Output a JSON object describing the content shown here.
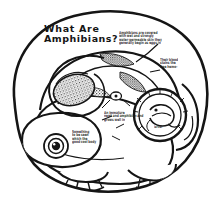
{
  "meta": {
    "medium": "hand-drawn black ink line illustration on white paper",
    "background_color": "#ffffff",
    "ink_color": "#151515"
  },
  "title": {
    "line1": "What Are",
    "line2": "Amphibians?",
    "full": "What Are Amphibians?"
  },
  "annotations": [
    {
      "name": "note-top-right",
      "legible": false,
      "lines": [
        "Amphibians are covered",
        "with wet and strongly",
        "water-permeable skin they",
        "generally begin as eggs in"
      ]
    },
    {
      "name": "note-right",
      "legible": false,
      "lines": [
        "Their blood",
        "stains the",
        "free hemo-"
      ]
    },
    {
      "name": "note-mid",
      "legible": false,
      "lines": [
        "An immature",
        "newt and amphibian and",
        "grows well in"
      ]
    },
    {
      "name": "note-eye",
      "legible": false,
      "lines": [
        "Something",
        "to be seen",
        "which the",
        "good cool body"
      ]
    },
    {
      "name": "note-inset-caption",
      "legible": false,
      "lines": [
        "larval"
      ]
    }
  ],
  "figures": [
    {
      "name": "outer-blob-frame",
      "description": "thick rounded irregular outline enclosing the whole drawing"
    },
    {
      "name": "salamander-body",
      "description": "large curled amphibian body filling lower half"
    },
    {
      "name": "salamander-eye",
      "description": "concentric ring eye with dark pupil and highlight"
    },
    {
      "name": "egg-spiral",
      "description": "stippled comma / spiral egg-mass shape upper left"
    },
    {
      "name": "shading-wedges",
      "description": "dark stippled wedges along the back"
    },
    {
      "name": "tadpole-inset",
      "description": "circular inset containing a coiled tadpole / embryo sketch"
    },
    {
      "name": "webbed-feet",
      "description": "front and hind limbs with splayed webbed toes"
    },
    {
      "name": "tail",
      "description": "thick tapering tail curving to the right"
    }
  ]
}
